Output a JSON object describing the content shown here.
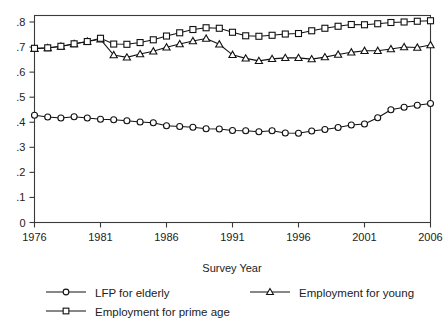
{
  "chart_data": {
    "type": "line",
    "title": "",
    "xlabel": "Survey Year",
    "ylabel": "",
    "xlim": [
      1976,
      2006
    ],
    "ylim": [
      0,
      0.83
    ],
    "grid": false,
    "legend_position": "bottom",
    "xticks": [
      "1976",
      "1981",
      "1986",
      "1991",
      "1996",
      "2001",
      "2006"
    ],
    "xtick_values": [
      1976,
      1981,
      1986,
      1991,
      1996,
      2001,
      2006
    ],
    "yticks": [
      "0",
      ".1",
      ".2",
      ".3",
      ".4",
      ".5",
      ".6",
      ".7",
      ".8"
    ],
    "ytick_values": [
      0,
      0.1,
      0.2,
      0.3,
      0.4,
      0.5,
      0.6,
      0.7,
      0.8
    ],
    "x": [
      1976,
      1977,
      1978,
      1979,
      1980,
      1981,
      1982,
      1983,
      1984,
      1985,
      1986,
      1987,
      1988,
      1989,
      1990,
      1991,
      1992,
      1993,
      1994,
      1995,
      1996,
      1997,
      1998,
      1999,
      2000,
      2001,
      2002,
      2003,
      2004,
      2005,
      2006
    ],
    "series": [
      {
        "name": "LFP for elderly",
        "marker": "circle",
        "values": [
          0.428,
          0.421,
          0.417,
          0.422,
          0.417,
          0.412,
          0.41,
          0.406,
          0.401,
          0.398,
          0.386,
          0.383,
          0.38,
          0.374,
          0.373,
          0.367,
          0.366,
          0.362,
          0.366,
          0.357,
          0.356,
          0.365,
          0.371,
          0.379,
          0.389,
          0.393,
          0.418,
          0.45,
          0.46,
          0.468,
          0.475
        ]
      },
      {
        "name": "Employment for young",
        "marker": "triangle",
        "values": [
          0.693,
          0.696,
          0.702,
          0.712,
          0.722,
          0.731,
          0.668,
          0.659,
          0.672,
          0.683,
          0.699,
          0.712,
          0.724,
          0.734,
          0.711,
          0.669,
          0.655,
          0.645,
          0.653,
          0.657,
          0.657,
          0.652,
          0.66,
          0.67,
          0.679,
          0.685,
          0.685,
          0.692,
          0.7,
          0.698,
          0.708
        ]
      },
      {
        "name": "Employment for prime age",
        "marker": "square",
        "values": [
          0.695,
          0.697,
          0.703,
          0.713,
          0.722,
          0.735,
          0.712,
          0.711,
          0.718,
          0.729,
          0.744,
          0.757,
          0.77,
          0.777,
          0.775,
          0.759,
          0.745,
          0.743,
          0.747,
          0.752,
          0.754,
          0.765,
          0.775,
          0.783,
          0.79,
          0.789,
          0.793,
          0.798,
          0.8,
          0.803,
          0.805
        ]
      }
    ]
  },
  "legend": {
    "items": [
      {
        "label": "LFP for elderly",
        "marker": "circle"
      },
      {
        "label": "Employment for young",
        "marker": "triangle"
      },
      {
        "label": "Employment for prime age",
        "marker": "square"
      }
    ]
  },
  "axis": {
    "x_title": "Survey Year"
  }
}
